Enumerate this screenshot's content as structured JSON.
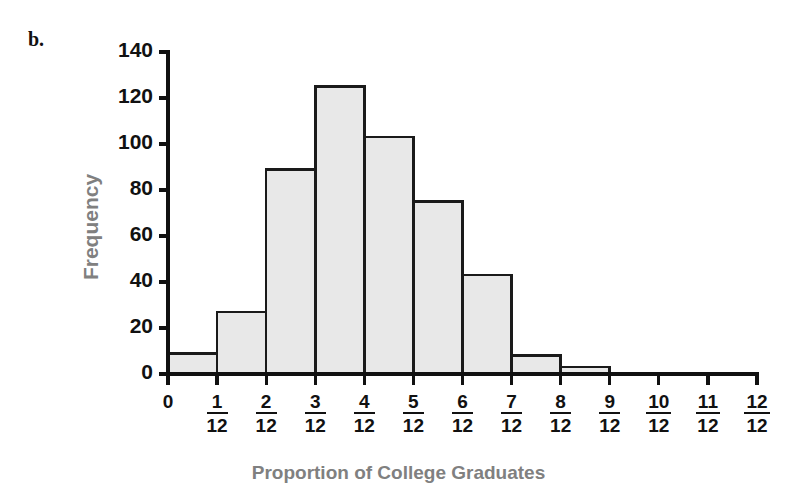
{
  "panel": {
    "letter": "b."
  },
  "axes": {
    "y_title": "Frequency",
    "x_title": "Proportion of College Graduates"
  },
  "colors": {
    "bar_fill": "#e8e8e8",
    "bar_stroke": "#1a1a1a",
    "axis": "#111111",
    "axis_title": "#808080",
    "tick_label": "#111111",
    "background": "#ffffff"
  },
  "chart_data": {
    "type": "bar",
    "title": "",
    "subtitle": "",
    "xlabel": "Proportion of College Graduates",
    "ylabel": "Frequency",
    "grid": false,
    "legend": null,
    "ylim": [
      0,
      140
    ],
    "ytick_step": 20,
    "ytick_labels": [
      "0",
      "20",
      "40",
      "60",
      "80",
      "100",
      "120",
      "140"
    ],
    "ytick_values": [
      0,
      20,
      40,
      60,
      80,
      100,
      120,
      140
    ],
    "xtick_labels": [
      "0",
      "1/12",
      "2/12",
      "3/12",
      "4/12",
      "5/12",
      "6/12",
      "7/12",
      "8/12",
      "9/12",
      "10/12",
      "11/12",
      "12/12"
    ],
    "xtick_numerators": [
      "0",
      "1",
      "2",
      "3",
      "4",
      "5",
      "6",
      "7",
      "8",
      "9",
      "10",
      "11",
      "12"
    ],
    "xtick_denominator": "12",
    "bin_edges": [
      0,
      1,
      2,
      3,
      4,
      5,
      6,
      7,
      8,
      9,
      10,
      11,
      12
    ],
    "categories": [
      "0-1/12",
      "1/12-2/12",
      "2/12-3/12",
      "3/12-4/12",
      "4/12-5/12",
      "5/12-6/12",
      "6/12-7/12",
      "7/12-8/12",
      "8/12-9/12",
      "9/12-10/12",
      "10/12-11/12",
      "11/12-12/12"
    ],
    "values": [
      9,
      27,
      89,
      125,
      103,
      75,
      43,
      8,
      3,
      0,
      0,
      0
    ]
  }
}
